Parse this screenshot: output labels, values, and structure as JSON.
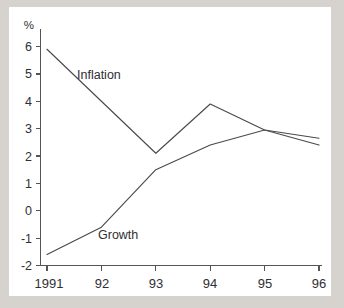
{
  "chart_data": {
    "type": "line",
    "title": "",
    "xlabel": "",
    "ylabel": "%",
    "y_unit_label": "%",
    "x": [
      "1991",
      "92",
      "93",
      "94",
      "95",
      "96"
    ],
    "categories": [
      "1991",
      "92",
      "93",
      "94",
      "95",
      "96"
    ],
    "xticklabels": [
      "1991",
      "92",
      "93",
      "94",
      "95",
      "96"
    ],
    "yticklabels": [
      "6",
      "5",
      "4",
      "3",
      "2",
      "1",
      "0",
      "-1",
      "-2"
    ],
    "ytickvalues": [
      6,
      5,
      4,
      3,
      2,
      1,
      0,
      -1,
      -2
    ],
    "ylim": [
      -2,
      6
    ],
    "xlim": [
      1991,
      96
    ],
    "grid": false,
    "legend": "inline-labels",
    "series": [
      {
        "name": "Inflation",
        "label": "Inflation",
        "color": "#4a4a4e",
        "values": [
          5.9,
          4.0,
          2.1,
          3.9,
          2.95,
          2.65
        ]
      },
      {
        "name": "Growth",
        "label": "Growth",
        "color": "#4a4a4e",
        "values": [
          -1.6,
          -0.6,
          1.5,
          2.4,
          2.95,
          2.4
        ]
      }
    ],
    "annotations": [
      {
        "text": "Inflation",
        "series": "Inflation"
      },
      {
        "text": "Growth",
        "series": "Growth"
      }
    ]
  },
  "axis": {
    "y_unit": "%",
    "y_labels": [
      "6",
      "5",
      "4",
      "3",
      "2",
      "1",
      "0",
      "-1",
      "-2"
    ],
    "x_labels": [
      "1991",
      "92",
      "93",
      "94",
      "95",
      "96"
    ]
  },
  "labels": {
    "inflation": "Inflation",
    "growth": "Growth"
  },
  "colors": {
    "line": "#4a4a4e",
    "axis": "#555558",
    "text": "#2f2f33",
    "figure_background": "#ffffff",
    "page_background": "#d6d3ce"
  }
}
